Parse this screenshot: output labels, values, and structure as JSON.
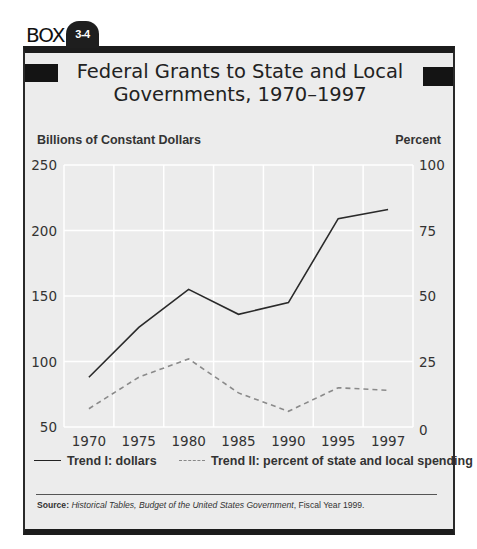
{
  "box": {
    "label": "BOX",
    "number": "3-4"
  },
  "title_line1": "Federal Grants to State and Local",
  "title_line2": "Governments, 1970–1997",
  "left_axis_title": "Billions of Constant Dollars",
  "right_axis_title": "Percent",
  "legend": {
    "trend1": "Trend I: dollars",
    "trend2": "Trend II: percent of state and local spending"
  },
  "source": {
    "label": "Source:",
    "italic": "Historical Tables, Budget of the United States Government",
    "rest": ", Fiscal Year 1999."
  },
  "colors": {
    "plot_bg": "#ececec",
    "grid": "#ffffff",
    "trend1": "#2a2a2a",
    "trend2": "#8a8a8a"
  },
  "chart_data": {
    "type": "line",
    "title": "Federal Grants to State and Local Governments, 1970–1997",
    "categories": [
      "1970",
      "1975",
      "1980",
      "1985",
      "1990",
      "1995",
      "1997"
    ],
    "xlabel": "",
    "ylabel": "Billions of Constant Dollars",
    "ylabel_right": "Percent",
    "ylim": [
      50,
      250
    ],
    "ylim_right": [
      0,
      100
    ],
    "yticks": [
      50,
      100,
      150,
      200,
      250
    ],
    "yticks_right": [
      0,
      25,
      50,
      75,
      100
    ],
    "grid": true,
    "legend_position": "bottom",
    "series": [
      {
        "name": "Trend I: dollars",
        "axis": "left",
        "style": "solid",
        "values": [
          88,
          126,
          155,
          136,
          145,
          209,
          216
        ]
      },
      {
        "name": "Trend II: percent of state and local spending",
        "axis": "right",
        "style": "dashed",
        "values": [
          7,
          19,
          26,
          13,
          6,
          15,
          14
        ]
      }
    ]
  }
}
